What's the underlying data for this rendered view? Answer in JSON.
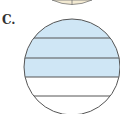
{
  "label": "C.",
  "figure": {
    "type": "fraction-circle",
    "total_parts": 5,
    "shaded_parts": 3,
    "shade_color": "#cfe6f5",
    "line_color": "#555555",
    "top_partial_circle_color": "#f3ead2"
  }
}
